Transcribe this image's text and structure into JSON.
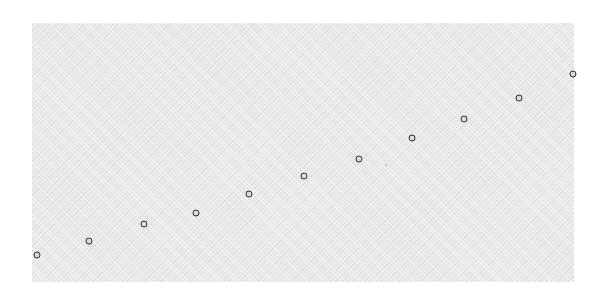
{
  "figure": {
    "width": 608,
    "height": 300,
    "background_color": "#ffffff"
  },
  "panel": {
    "name": "plot-panel",
    "x": 32,
    "y": 23,
    "width": 542,
    "height": 259,
    "facecolor": "#e4e4e4",
    "grid": false,
    "axes_visible": false,
    "tick_labels_visible": false
  },
  "marker_style": {
    "shape": "open-circle",
    "edge_color": "#2b2b2b",
    "face_color": "#dcdcdc",
    "size_px": 7,
    "edge_width_px": 1.6
  },
  "chart_data": {
    "type": "scatter",
    "title": "",
    "subtitle": "",
    "xlabel": "",
    "ylabel": "",
    "legend": [],
    "annotations": [],
    "grid": false,
    "xlim": [
      32,
      574
    ],
    "ylim": [
      23,
      282
    ],
    "xtick_labels": [],
    "ytick_labels": [],
    "series": [
      {
        "name": "points",
        "marker": "open-circle",
        "color": "#2b2b2b",
        "points": [
          {
            "px": 37,
            "py": 255
          },
          {
            "px": 89,
            "py": 241
          },
          {
            "px": 144,
            "py": 224
          },
          {
            "px": 196,
            "py": 213
          },
          {
            "px": 249,
            "py": 194
          },
          {
            "px": 304,
            "py": 176
          },
          {
            "px": 359,
            "py": 159
          },
          {
            "px": 412,
            "py": 138
          },
          {
            "px": 464,
            "py": 119
          },
          {
            "px": 519,
            "py": 98
          },
          {
            "px": 573,
            "py": 74
          }
        ]
      }
    ],
    "faint_specks": [
      {
        "px": 386,
        "py": 165,
        "size_px": 2
      }
    ]
  }
}
